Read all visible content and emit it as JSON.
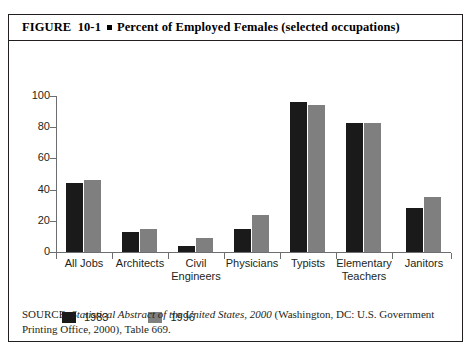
{
  "figure": {
    "number": "FIGURE  10-1",
    "bullet": "square-bullet",
    "title": "Percent of Employed Females (selected occupations)"
  },
  "source": {
    "prefix": "SOURCE:",
    "italic_part": "Statistical Abstract of the United States, 2000",
    "rest": " (Washington, DC: U.S. Government Printing Office, 2000), Table 669."
  },
  "colors": {
    "series_1983": "#1a1a1a",
    "series_1996": "#7f7f7f",
    "axis": "#6d6e71",
    "border": "#231f20",
    "background": "#ffffff"
  },
  "chart_data": {
    "type": "bar",
    "title": "Percent of Employed Females (selected occupations)",
    "xlabel": "",
    "ylabel": "",
    "ylim": [
      0,
      100
    ],
    "yticks": [
      0,
      20,
      40,
      60,
      80,
      100
    ],
    "ytick_labels": [
      "0",
      "20",
      "40",
      "60",
      "80",
      "100"
    ],
    "grid": false,
    "legend_position": "below-axis-left",
    "categories": [
      "All Jobs",
      "Architects",
      "Civil\nEngineers",
      "Physicians",
      "Typists",
      "Elementary\nTeachers",
      "Janitors"
    ],
    "series": [
      {
        "name": "1983",
        "color": "#1a1a1a",
        "values": [
          44,
          13,
          4,
          15,
          96,
          83,
          28
        ]
      },
      {
        "name": "1996",
        "color": "#7f7f7f",
        "values": [
          46,
          15,
          9,
          24,
          94,
          83,
          35
        ]
      }
    ]
  }
}
